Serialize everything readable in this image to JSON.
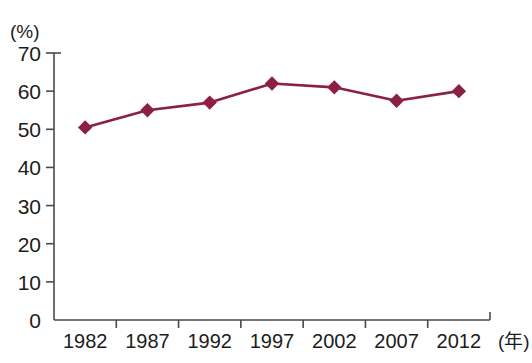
{
  "chart_data": {
    "type": "line",
    "title": "",
    "subtitle": "",
    "xlabel": "(年)",
    "ylabel": "(%)",
    "categories": [
      "1982",
      "1987",
      "1992",
      "1997",
      "2002",
      "2007",
      "2012"
    ],
    "values": [
      50.5,
      55,
      57,
      62,
      61,
      57.5,
      60
    ],
    "series": [
      {
        "name": "",
        "values": [
          50.5,
          55,
          57,
          62,
          61,
          57.5,
          60
        ],
        "color": "#8B2042",
        "marker": "diamond"
      }
    ],
    "ylim": [
      0,
      70
    ],
    "ytick_labels": [
      "70",
      "60",
      "50",
      "40",
      "30",
      "20",
      "10",
      "0"
    ],
    "ytick_values": [
      70,
      60,
      50,
      40,
      30,
      20,
      10,
      0
    ],
    "xtick_labels": [
      "1982",
      "1987",
      "1992",
      "1997",
      "2002",
      "2007",
      "2012"
    ],
    "grid": false,
    "legend": false,
    "legend_position": "none",
    "annotations": []
  },
  "axes": {
    "y_unit_label": "(%)",
    "x_unit_label": "(年)"
  }
}
